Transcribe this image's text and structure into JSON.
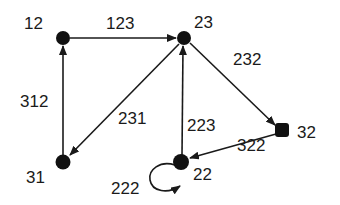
{
  "diagram": {
    "type": "directed-graph",
    "nodes": [
      {
        "id": "12",
        "label": "12"
      },
      {
        "id": "23",
        "label": "23"
      },
      {
        "id": "32",
        "label": "32"
      },
      {
        "id": "22",
        "label": "22"
      },
      {
        "id": "31",
        "label": "31"
      }
    ],
    "edges": [
      {
        "from": "12",
        "to": "23",
        "label": "123"
      },
      {
        "from": "23",
        "to": "32",
        "label": "232"
      },
      {
        "from": "23",
        "to": "31",
        "label": "231"
      },
      {
        "from": "22",
        "to": "23",
        "label": "223"
      },
      {
        "from": "32",
        "to": "22",
        "label": "322"
      },
      {
        "from": "31",
        "to": "12",
        "label": "312"
      },
      {
        "from": "22",
        "to": "22",
        "label": "222"
      }
    ]
  }
}
